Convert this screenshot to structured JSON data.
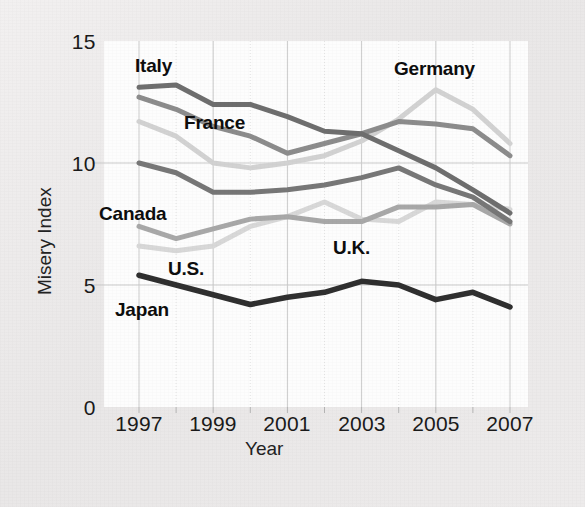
{
  "figure": {
    "background_color": "#edebeb",
    "plot_background_color": "#fdfdfd",
    "grid_color": "#c9c9c9"
  },
  "axis": {
    "y_title": "Misery Index",
    "x_title": "Year",
    "y_ticks": [
      "15",
      "10",
      "5",
      "0"
    ],
    "x_ticks": [
      "1997",
      "1999",
      "2001",
      "2003",
      "2005",
      "2007"
    ]
  },
  "series_labels": [
    {
      "name": "Italy",
      "text": "Italy"
    },
    {
      "name": "France",
      "text": "France"
    },
    {
      "name": "Germany",
      "text": "Germany"
    },
    {
      "name": "Canada",
      "text": "Canada"
    },
    {
      "name": "US",
      "text": "U.S."
    },
    {
      "name": "UK",
      "text": "U.K."
    },
    {
      "name": "Japan",
      "text": "Japan"
    }
  ],
  "chart_data": {
    "type": "line",
    "title": "",
    "xlabel": "Year",
    "ylabel": "Misery Index",
    "xlim": [
      1997,
      2007
    ],
    "ylim": [
      0,
      15
    ],
    "yticks": [
      0,
      5,
      10,
      15
    ],
    "xticks": [
      1997,
      1999,
      2001,
      2003,
      2005,
      2007
    ],
    "grid": true,
    "legend": "inline-annotations",
    "x": [
      1997,
      1998,
      1999,
      2000,
      2001,
      2002,
      2003,
      2004,
      2005,
      2006,
      2007
    ],
    "series": [
      {
        "name": "Italy",
        "color": "#6e6e6e",
        "values": [
          13.1,
          13.2,
          12.4,
          12.4,
          11.9,
          11.3,
          11.2,
          10.5,
          9.8,
          8.9,
          7.95
        ]
      },
      {
        "name": "France",
        "color": "#8c8c8c",
        "values": [
          12.7,
          12.2,
          11.5,
          11.1,
          10.4,
          10.8,
          11.2,
          11.7,
          11.6,
          11.4,
          10.3
        ]
      },
      {
        "name": "Germany",
        "color": "#d2d2d2",
        "values": [
          11.7,
          11.1,
          10.0,
          9.8,
          10.0,
          10.3,
          10.9,
          11.8,
          13.0,
          12.2,
          10.8
        ]
      },
      {
        "name": "Canada",
        "color": "#777777",
        "values": [
          10.0,
          9.6,
          8.8,
          8.8,
          8.9,
          9.1,
          9.4,
          9.8,
          9.1,
          8.6,
          7.6
        ]
      },
      {
        "name": "UK",
        "color": "#a8a8a8",
        "values": [
          7.4,
          6.9,
          7.3,
          7.7,
          7.8,
          7.6,
          7.6,
          8.2,
          8.2,
          8.3,
          7.5
        ]
      },
      {
        "name": "US",
        "color": "#d8d8d8",
        "values": [
          6.6,
          6.4,
          6.6,
          7.4,
          7.8,
          8.4,
          7.7,
          7.6,
          8.4,
          8.3,
          8.1
        ]
      },
      {
        "name": "Japan",
        "color": "#2f2f2f",
        "values": [
          5.4,
          5.0,
          4.6,
          4.2,
          4.5,
          4.7,
          5.15,
          5.0,
          4.4,
          4.7,
          4.1
        ]
      }
    ]
  }
}
